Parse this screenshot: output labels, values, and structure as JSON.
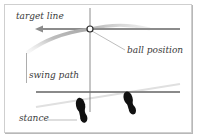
{
  "diagram": {
    "labels": {
      "target_line": "target line",
      "ball_position": "ball position",
      "swing_path": "swing path",
      "stance": "stance"
    },
    "colors": {
      "frame": "#c8c8c8",
      "target_line": "#8c8c8c",
      "stance_line": "#8a8a8a",
      "swing_path": "#c4c4c4",
      "diagonal": "#e2e2e2",
      "vertical": "#6e6e6e",
      "feet": "#111111",
      "ball_fill": "#ffffff",
      "ball_stroke": "#333333",
      "leader": "#9a9a9a"
    }
  }
}
